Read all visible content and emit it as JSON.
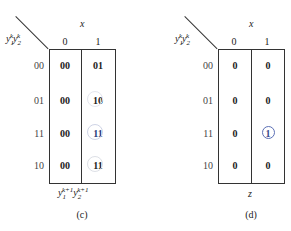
{
  "tables": [
    {
      "id": "c",
      "col_var": "x",
      "row_var_label": "y1^k y2^k",
      "columns": [
        "0",
        "1"
      ],
      "rows": [
        "00",
        "01",
        "11",
        "10"
      ],
      "cells": [
        [
          "00",
          "01"
        ],
        [
          "00",
          "10"
        ],
        [
          "00",
          "11"
        ],
        [
          "00",
          "11"
        ]
      ],
      "circled": [
        [
          1,
          1
        ],
        [
          2,
          1
        ],
        [
          3,
          1
        ]
      ],
      "output_label": "y1^{k+1} y2^{k+1}",
      "caption": "(c)"
    },
    {
      "id": "d",
      "col_var": "x",
      "row_var_label": "y1^k y2^k",
      "columns": [
        "0",
        "1"
      ],
      "rows": [
        "00",
        "01",
        "11",
        "10"
      ],
      "cells": [
        [
          "0",
          "0"
        ],
        [
          "0",
          "0"
        ],
        [
          "0",
          "1"
        ],
        [
          "0",
          "0"
        ]
      ],
      "circled": [
        [
          2,
          1
        ]
      ],
      "output_label": "z",
      "caption": "(d)"
    }
  ],
  "labels": {
    "y": "y",
    "one": "1",
    "two": "2",
    "k": "k",
    "kp1": "k+1"
  },
  "colors": {
    "line": "#333333",
    "circle": "#5b6fb5"
  }
}
